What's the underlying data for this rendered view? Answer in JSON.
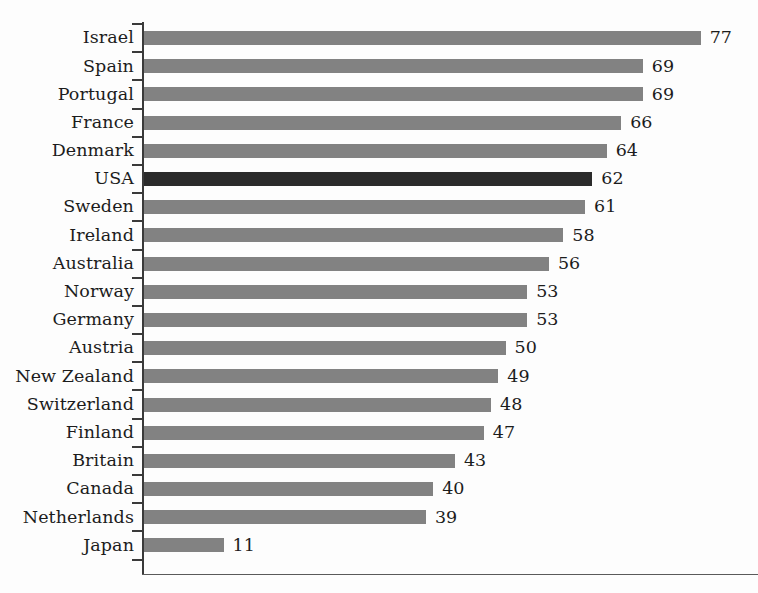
{
  "chart_data": {
    "type": "bar",
    "orientation": "horizontal",
    "title": "",
    "subtitle": "",
    "xlabel": "",
    "ylabel": "",
    "xlim": [
      0,
      77
    ],
    "grid": false,
    "legend": false,
    "highlight_category": "USA",
    "colors": {
      "bar": "#828282",
      "bar_highlight": "#2b2b2b",
      "axis": "#3a3a3a",
      "text": "#1c1c1c",
      "background": "#fdfdfd"
    },
    "categories": [
      "Israel",
      "Spain",
      "Portugal",
      "France",
      "Denmark",
      "USA",
      "Sweden",
      "Ireland",
      "Australia",
      "Norway",
      "Germany",
      "Austria",
      "New Zealand",
      "Switzerland",
      "Finland",
      "Britain",
      "Canada",
      "Netherlands",
      "Japan"
    ],
    "values": [
      77,
      69,
      69,
      66,
      64,
      62,
      61,
      58,
      56,
      53,
      53,
      50,
      49,
      48,
      47,
      43,
      40,
      39,
      11
    ],
    "value_labels": [
      "77",
      "69",
      "69",
      "66",
      "64",
      "62",
      "61",
      "58",
      "56",
      "53",
      "53",
      "50",
      "49",
      "48",
      "47",
      "43",
      "40",
      "39",
      "11"
    ],
    "bars": [
      {
        "label": "Israel",
        "value": 77,
        "value_label": "77",
        "highlight": false
      },
      {
        "label": "Spain",
        "value": 69,
        "value_label": "69",
        "highlight": false
      },
      {
        "label": "Portugal",
        "value": 69,
        "value_label": "69",
        "highlight": false
      },
      {
        "label": "France",
        "value": 66,
        "value_label": "66",
        "highlight": false
      },
      {
        "label": "Denmark",
        "value": 64,
        "value_label": "64",
        "highlight": false
      },
      {
        "label": "USA",
        "value": 62,
        "value_label": "62",
        "highlight": true
      },
      {
        "label": "Sweden",
        "value": 61,
        "value_label": "61",
        "highlight": false
      },
      {
        "label": "Ireland",
        "value": 58,
        "value_label": "58",
        "highlight": false
      },
      {
        "label": "Australia",
        "value": 56,
        "value_label": "56",
        "highlight": false
      },
      {
        "label": "Norway",
        "value": 53,
        "value_label": "53",
        "highlight": false
      },
      {
        "label": "Germany",
        "value": 53,
        "value_label": "53",
        "highlight": false
      },
      {
        "label": "Austria",
        "value": 50,
        "value_label": "50",
        "highlight": false
      },
      {
        "label": "New Zealand",
        "value": 49,
        "value_label": "49",
        "highlight": false
      },
      {
        "label": "Switzerland",
        "value": 48,
        "value_label": "48",
        "highlight": false
      },
      {
        "label": "Finland",
        "value": 47,
        "value_label": "47",
        "highlight": false
      },
      {
        "label": "Britain",
        "value": 43,
        "value_label": "43",
        "highlight": false
      },
      {
        "label": "Canada",
        "value": 40,
        "value_label": "40",
        "highlight": false
      },
      {
        "label": "Netherlands",
        "value": 39,
        "value_label": "39",
        "highlight": false
      },
      {
        "label": "Japan",
        "value": 11,
        "value_label": "11",
        "highlight": false
      }
    ]
  },
  "render": {
    "px_per_unit": 7.23
  }
}
